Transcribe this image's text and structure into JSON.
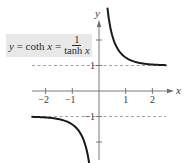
{
  "chart_data": {
    "type": "line",
    "title": "",
    "equation_label": {
      "lhs": "y",
      "equals1": "=",
      "func": "coth",
      "var": "x",
      "equals2": "=",
      "numerator": "1",
      "denominator_func": "tanh",
      "denominator_var": "x"
    },
    "xlabel": "x",
    "ylabel": "y",
    "x_ticks": [
      -2,
      -1,
      1,
      2
    ],
    "x_tick_labels": [
      "−2",
      "−1",
      "1",
      "2"
    ],
    "y_ticks": [
      -2,
      -1,
      1,
      2
    ],
    "y_tick_labels": [
      "−1",
      "1"
    ],
    "xlim": [
      -2.6,
      2.8
    ],
    "ylim": [
      -2.8,
      3.3
    ],
    "grid": false,
    "asymptotes": [
      {
        "type": "horizontal",
        "y": 1,
        "style": "dashed"
      },
      {
        "type": "horizontal",
        "y": -1,
        "style": "dashed"
      },
      {
        "type": "vertical",
        "x": 0,
        "style": "axis"
      }
    ],
    "series": [
      {
        "name": "y = coth x (x > 0)",
        "x": [
          0.32,
          0.4,
          0.5,
          0.6,
          0.8,
          1.0,
          1.25,
          1.5,
          1.75,
          2.0,
          2.25,
          2.5
        ],
        "y": [
          3.22,
          2.63,
          2.16,
          1.86,
          1.5,
          1.31,
          1.18,
          1.1,
          1.06,
          1.04,
          1.02,
          1.01
        ]
      },
      {
        "name": "y = coth x (x < 0)",
        "x": [
          -2.5,
          -2.25,
          -2.0,
          -1.75,
          -1.5,
          -1.25,
          -1.0,
          -0.8,
          -0.6,
          -0.5,
          -0.4,
          -0.32
        ],
        "y": [
          -1.01,
          -1.02,
          -1.04,
          -1.06,
          -1.1,
          -1.18,
          -1.31,
          -1.5,
          -1.86,
          -2.16,
          -2.63,
          -3.22
        ]
      }
    ]
  },
  "colors": {
    "curve": "#1a1a1a",
    "axis": "#6b6b6b",
    "asymptote": "#8a8a8a",
    "label_bg": "#e8e8e8"
  }
}
